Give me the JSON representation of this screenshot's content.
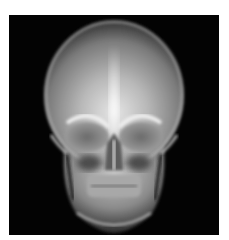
{
  "image": {
    "subject": "Frontal (PA) X-ray radiograph of a human skull",
    "background_color": "#ffffff",
    "frame_color": "#030303",
    "bone_highlight_color": "#f2f2f2",
    "bone_mid_color": "#9a9a9a"
  }
}
